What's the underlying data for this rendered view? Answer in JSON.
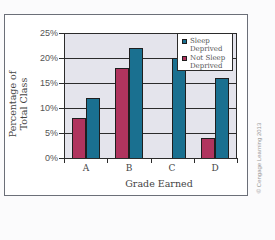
{
  "chart_data": {
    "type": "bar",
    "title": "",
    "xlabel": "Grade Earned",
    "ylabel": "Percentage of Total Class",
    "ylabel_lines": [
      "Percentage of",
      "Total Class"
    ],
    "categories": [
      "A",
      "B",
      "C",
      "D"
    ],
    "series": [
      {
        "name": "Not Sleep Deprived",
        "color": "#b0345e",
        "values": [
          8,
          18,
          0,
          4
        ]
      },
      {
        "name": "Sleep Deprived",
        "color": "#1a7090",
        "values": [
          12,
          22,
          20,
          16
        ]
      }
    ],
    "ylim": [
      0,
      25
    ],
    "yticks": [
      "0%",
      "5%",
      "10%",
      "15%",
      "20%",
      "25%"
    ],
    "grid": true,
    "legend_position": "upper right",
    "legend": [
      {
        "label_lines": [
          "Sleep",
          "Deprived"
        ],
        "color": "#1a7090"
      },
      {
        "label_lines": [
          "Not Sleep",
          "Deprived"
        ],
        "color": "#b0345e"
      }
    ],
    "plot_background": "#e4e4ec"
  },
  "credit": "© Cengage Learning 2013"
}
